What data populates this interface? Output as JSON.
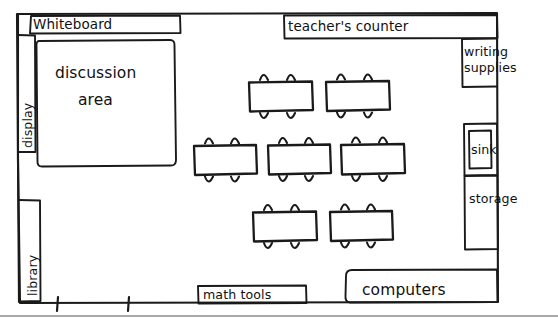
{
  "diagram": {
    "style": "hand-drawn pencil sketch",
    "ink_color": "#1a1a1a",
    "background_color": "#ffffff"
  },
  "zones": {
    "whiteboard": {
      "label": "Whiteboard",
      "wall": "top-left"
    },
    "teachers_counter": {
      "label": "teacher's counter",
      "wall": "top-right"
    },
    "writing_supplies": {
      "label": "writing supplies",
      "line1": "writing",
      "line2": "supplies",
      "wall": "right-top"
    },
    "sink": {
      "label": "sink",
      "wall": "right-middle"
    },
    "storage": {
      "label": "storage",
      "wall": "right-lower"
    },
    "computers": {
      "label": "computers",
      "wall": "bottom-right"
    },
    "math_tools": {
      "label": "math tools",
      "wall": "bottom-center"
    },
    "library": {
      "label": "library",
      "wall": "left-lower",
      "orientation": "vertical"
    },
    "display": {
      "label": "display",
      "wall": "left-upper",
      "orientation": "vertical"
    },
    "discussion_area": {
      "label": "discussion area",
      "line1": "discussion",
      "line2": "area",
      "region": "upper-left-floor"
    }
  },
  "furniture": {
    "desk_rows": [
      {
        "name": "back-row",
        "desk_count": 2,
        "chairs_per_desk": 4
      },
      {
        "name": "middle-row",
        "desk_count": 3,
        "chairs_per_desk": 4
      },
      {
        "name": "front-row",
        "desk_count": 2,
        "chairs_per_desk": 4
      }
    ],
    "total_desks": 7,
    "total_chairs": 28
  },
  "openings": {
    "doorway": {
      "name": "doorway",
      "wall": "bottom-left",
      "tick_count": 2
    }
  }
}
